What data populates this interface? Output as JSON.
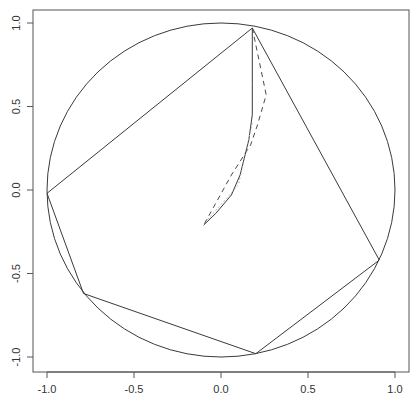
{
  "chart_data": {
    "type": "line",
    "title": "",
    "xlabel": "",
    "ylabel": "",
    "xlim": [
      -1.08,
      1.08
    ],
    "ylim": [
      -1.09,
      1.08
    ],
    "grid": false,
    "legend": null,
    "x_ticks": [
      -1.0,
      -0.5,
      0.0,
      0.5,
      1.0
    ],
    "x_tick_labels": [
      "-1.0",
      "-0.5",
      "0.0",
      "0.5",
      "1.0"
    ],
    "y_ticks": [
      -1.0,
      -0.5,
      0.0,
      0.5,
      1.0
    ],
    "y_tick_labels": [
      "-1.0",
      "-0.5",
      "0.0",
      "0.5",
      "1.0"
    ],
    "unit_circle": {
      "center": [
        0,
        0
      ],
      "radius": 1.0
    },
    "series": [
      {
        "name": "polygon",
        "style": "solid",
        "closed": true,
        "points": [
          [
            0.18,
            0.97
          ],
          [
            0.91,
            -0.42
          ],
          [
            0.2,
            -0.98
          ],
          [
            -0.79,
            -0.62
          ],
          [
            -1.0,
            -0.02
          ],
          [
            0.18,
            0.97
          ]
        ]
      },
      {
        "name": "path-solid",
        "style": "solid",
        "points": [
          [
            0.18,
            0.97
          ],
          [
            0.18,
            0.63
          ],
          [
            0.18,
            0.45
          ],
          [
            0.16,
            0.3
          ],
          [
            0.11,
            0.09
          ],
          [
            0.06,
            -0.03
          ],
          [
            -0.03,
            -0.14
          ],
          [
            -0.1,
            -0.21
          ]
        ]
      },
      {
        "name": "path-dashed",
        "style": "dashed",
        "points": [
          [
            0.18,
            0.97
          ],
          [
            0.26,
            0.57
          ],
          [
            0.21,
            0.39
          ],
          [
            0.17,
            0.27
          ],
          [
            0.06,
            0.09
          ],
          [
            -0.1,
            -0.21
          ]
        ]
      },
      {
        "name": "path-dotted",
        "style": "dotted",
        "points": [
          [
            0.18,
            0.4
          ],
          [
            0.14,
            0.22
          ],
          [
            0.1,
            0.03
          ],
          [
            -0.08,
            -0.18
          ]
        ]
      }
    ]
  },
  "axes": {
    "x_tick_labels": [
      "-1.0",
      "-0.5",
      "0.0",
      "0.5",
      "1.0"
    ],
    "y_tick_labels": [
      "-1.0",
      "-0.5",
      "0.0",
      "0.5",
      "1.0"
    ]
  },
  "colors": {
    "line": "#3a3a3a",
    "dashed": "#4a4a4a",
    "dotted": "#a8a8a8",
    "axis": "#555555"
  }
}
